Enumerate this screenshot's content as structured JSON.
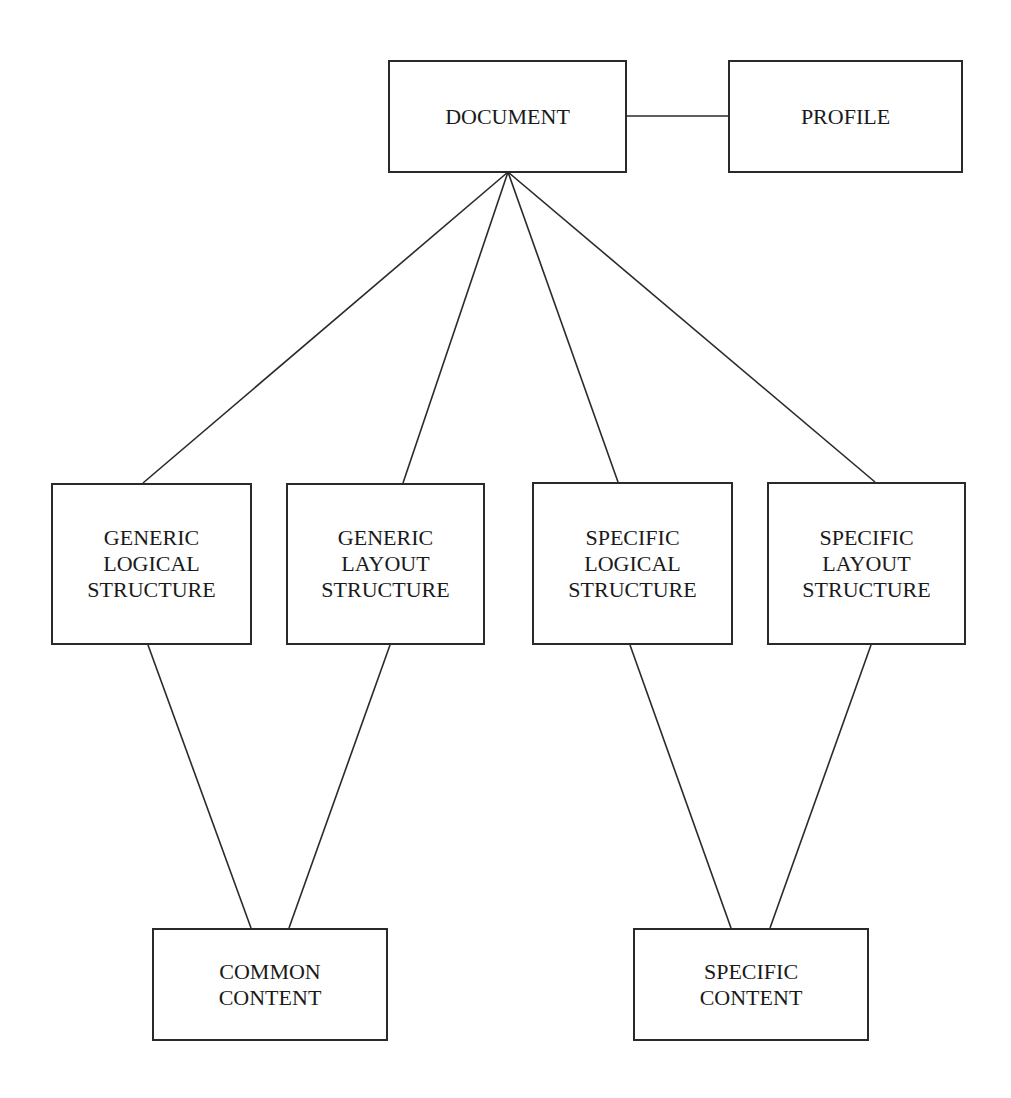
{
  "diagram": {
    "background": "#ffffff",
    "stroke_color": "#2a2a2a",
    "nodes": {
      "document": {
        "label": "DOCUMENT",
        "x": 388,
        "y": 60,
        "w": 239,
        "h": 113
      },
      "profile": {
        "label": "PROFILE",
        "x": 728,
        "y": 60,
        "w": 235,
        "h": 113
      },
      "generic_logical": {
        "label": "GENERIC\nLOGICAL\nSTRUCTURE",
        "x": 51,
        "y": 483,
        "w": 201,
        "h": 162
      },
      "generic_layout": {
        "label": "GENERIC\nLAYOUT\nSTRUCTURE",
        "x": 286,
        "y": 483,
        "w": 199,
        "h": 162
      },
      "specific_logical": {
        "label": "SPECIFIC\nLOGICAL\nSTRUCTURE",
        "x": 532,
        "y": 482,
        "w": 201,
        "h": 163
      },
      "specific_layout": {
        "label": "SPECIFIC\nLAYOUT\nSTRUCTURE",
        "x": 767,
        "y": 482,
        "w": 199,
        "h": 163
      },
      "common_content": {
        "label": "COMMON\nCONTENT",
        "x": 152,
        "y": 928,
        "w": 236,
        "h": 113
      },
      "specific_content": {
        "label": "SPECIFIC\nCONTENT",
        "x": 633,
        "y": 928,
        "w": 236,
        "h": 113
      }
    },
    "edges": [
      {
        "from": "document",
        "to": "profile",
        "x1": 627,
        "y1": 116,
        "x2": 728,
        "y2": 116
      },
      {
        "from": "document",
        "to": "generic_logical",
        "x1": 508,
        "y1": 172,
        "x2": 143,
        "y2": 483
      },
      {
        "from": "document",
        "to": "generic_layout",
        "x1": 508,
        "y1": 172,
        "x2": 403,
        "y2": 483
      },
      {
        "from": "document",
        "to": "specific_logical",
        "x1": 508,
        "y1": 172,
        "x2": 618,
        "y2": 482
      },
      {
        "from": "document",
        "to": "specific_layout",
        "x1": 508,
        "y1": 172,
        "x2": 875,
        "y2": 482
      },
      {
        "from": "generic_logical",
        "to": "common_content",
        "x1": 148,
        "y1": 645,
        "x2": 251,
        "y2": 928
      },
      {
        "from": "generic_layout",
        "to": "common_content",
        "x1": 390,
        "y1": 645,
        "x2": 289,
        "y2": 928
      },
      {
        "from": "specific_logical",
        "to": "specific_content",
        "x1": 630,
        "y1": 645,
        "x2": 731,
        "y2": 928
      },
      {
        "from": "specific_layout",
        "to": "specific_content",
        "x1": 871,
        "y1": 645,
        "x2": 770,
        "y2": 928
      }
    ]
  }
}
